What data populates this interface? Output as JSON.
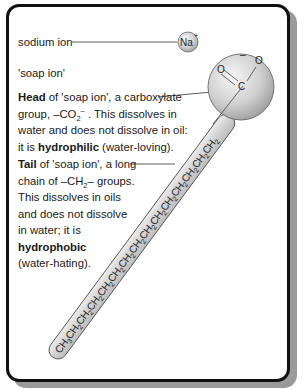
{
  "labels": {
    "sodium_ion": "sodium ion",
    "soap_ion": "'soap ion'",
    "na_symbol": "Na",
    "na_charge": "+",
    "head_charge": "–",
    "head_O1": "O",
    "head_O2": "O",
    "head_C": "C"
  },
  "head_description": {
    "bold": "Head",
    "line1_rest": " of 'soap ion', a carboxylate",
    "line2_pre": "group, –CO",
    "line2_sub": "2",
    "line2_sup": "–",
    "line2_post": " . This dissolves in",
    "line3": "water and does not dissolve in oil:",
    "line4_pre": "it is ",
    "line4_bold": "hydrophilic",
    "line4_post": " (water-loving)."
  },
  "tail_description": {
    "bold": "Tail",
    "line1_rest": " of 'soap ion', a long",
    "line2_pre": "chain of –CH",
    "line2_sub": "2",
    "line2_post": "– groups.",
    "line3": "This dissolves in oils",
    "line4": "and does not dissolve",
    "line5": "in water; it is",
    "line6_bold": "hydrophobic",
    "line7": "(water-hating)."
  },
  "chain": {
    "terminal": "CH3",
    "repeat_unit": "CH2",
    "repeat_count": 14,
    "text": "CH₃CH₂CH₂CH₂CH₂CH₂CH₂CH₂CH₂CH₂CH₂CH₂CH₂CH₂CH₂"
  },
  "colors": {
    "frame_border": "#111111",
    "shadow": "#9a9a9a",
    "sphere_light": "#f2f2f2",
    "sphere_dark": "#a8a8a8",
    "tail_fill": "#d6d6d6"
  }
}
